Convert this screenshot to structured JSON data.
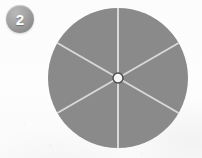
{
  "image": {
    "width": 202,
    "height": 158,
    "background_color": "#fdfdfd"
  },
  "badge": {
    "name": "step-badge",
    "number": "2",
    "text_color": "#ffffff",
    "fill_color": "#9a9a9a"
  },
  "chart_data": {
    "type": "pie",
    "title": "",
    "categories": [
      "Sector 1",
      "Sector 2",
      "Sector 3",
      "Sector 4",
      "Sector 5",
      "Sector 6"
    ],
    "values": [
      1,
      1,
      1,
      1,
      1,
      1
    ],
    "slice_percent": 16.67,
    "slice_angle_degrees": 60,
    "slice_count": 6,
    "fill_color": "#8a8a8a",
    "divider_color": "#d8d8d8",
    "divider_width": 2,
    "start_angle_degrees": 0,
    "legend": "none",
    "labels_shown": false,
    "hub": {
      "shown": true,
      "fill_color": "#f5f5f5",
      "stroke_color": "#4a4a4a",
      "radius": 5
    },
    "geometry": {
      "center_x": 118,
      "center_y": 78,
      "radius": 70
    }
  }
}
